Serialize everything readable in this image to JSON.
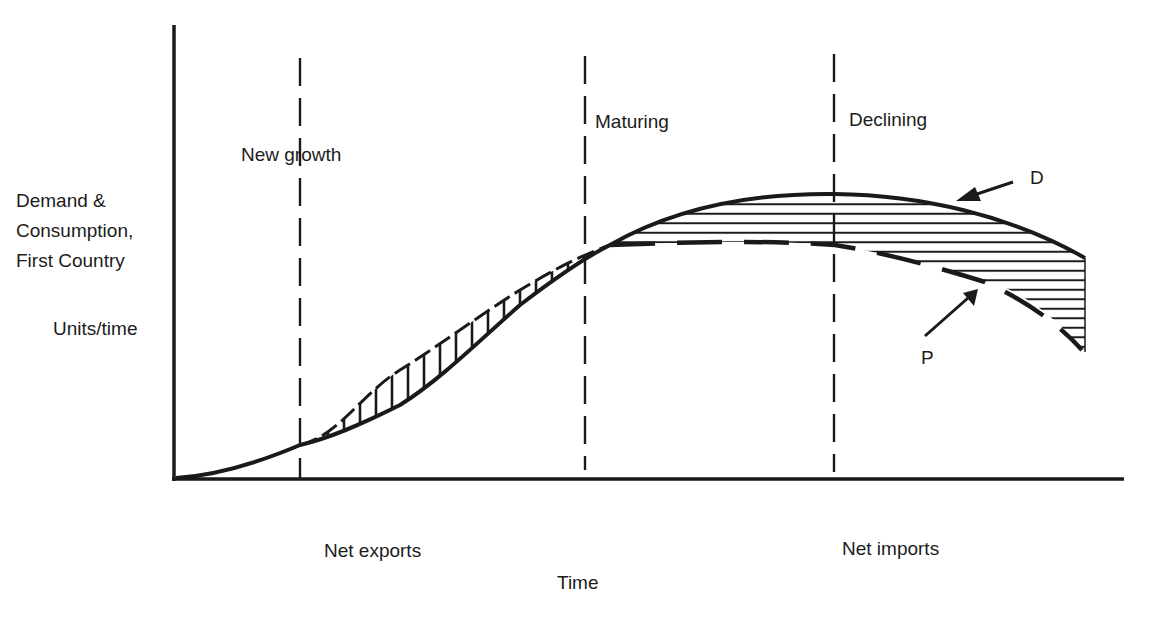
{
  "diagram": {
    "y_axis": {
      "label_lines": [
        "Demand &",
        "Consumption,",
        "First Country"
      ],
      "units": "Units/time"
    },
    "x_axis": {
      "label": "Time"
    },
    "stages": [
      {
        "label": "New growth"
      },
      {
        "label": "Maturing"
      },
      {
        "label": "Declining"
      }
    ],
    "trade_labels": {
      "left": "Net exports",
      "right": "Net imports"
    },
    "curves": {
      "demand": {
        "label": "D",
        "style": "solid"
      },
      "production": {
        "label": "P",
        "style": "dashed"
      }
    },
    "colors": {
      "ink": "#1a1a1a",
      "background": "#ffffff"
    }
  }
}
